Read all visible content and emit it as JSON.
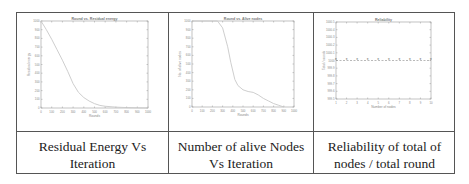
{
  "table": {
    "captions": [
      "Residual Energy Vs Iteration",
      "Number of alive Nodes Vs Iteration",
      "Reliability of total of nodes / total round"
    ]
  },
  "chart_data": [
    {
      "type": "line",
      "title": "Round vs. Residual energy",
      "xlabel": "Rounds",
      "ylabel": "Residual energy",
      "xlim": [
        0,
        1000
      ],
      "ylim": [
        0,
        1000
      ],
      "xticks": [
        0,
        100,
        200,
        300,
        400,
        500,
        600,
        700,
        800,
        900,
        1000
      ],
      "yticks": [
        0,
        100,
        200,
        300,
        400,
        500,
        600,
        700,
        800,
        900,
        1000
      ],
      "grid": false,
      "series": [
        {
          "name": "Residual energy",
          "x": [
            0,
            50,
            100,
            150,
            200,
            250,
            300,
            350,
            400,
            450,
            500,
            550,
            600,
            700,
            800,
            900,
            1000
          ],
          "y": [
            1000,
            900,
            790,
            670,
            550,
            420,
            280,
            180,
            120,
            80,
            50,
            30,
            20,
            10,
            5,
            2,
            0
          ]
        }
      ]
    },
    {
      "type": "line",
      "title": "Round vs. Alive nodes",
      "xlabel": "Rounds",
      "ylabel": "No. of alive nodes",
      "xlim": [
        0,
        1000
      ],
      "ylim": [
        0,
        1000
      ],
      "xticks": [
        0,
        100,
        200,
        300,
        400,
        500,
        600,
        700,
        800,
        900,
        1000
      ],
      "yticks": [
        0,
        100,
        200,
        300,
        400,
        500,
        600,
        700,
        800,
        900,
        1000
      ],
      "grid": false,
      "series": [
        {
          "name": "Alive nodes",
          "x": [
            0,
            250,
            300,
            350,
            380,
            420,
            450,
            500,
            550,
            600,
            650,
            700,
            750,
            800,
            850,
            900
          ],
          "y": [
            1000,
            1000,
            920,
            700,
            520,
            320,
            250,
            200,
            180,
            170,
            140,
            100,
            70,
            40,
            20,
            0
          ]
        }
      ]
    },
    {
      "type": "line",
      "title": "Reliability",
      "xlabel": "Number of nodes",
      "ylabel": "Total / rounds",
      "xlim": [
        1,
        10
      ],
      "ylim": [
        999.5,
        1000.5
      ],
      "xticks": [
        1,
        2,
        3,
        4,
        5,
        6,
        7,
        8,
        9,
        10
      ],
      "yticks": [
        999.5,
        999.6,
        999.7,
        999.8,
        999.9,
        1000,
        1000.1,
        1000.2,
        1000.3,
        1000.4,
        1000.5
      ],
      "grid": false,
      "series": [
        {
          "name": "Reliability",
          "x": [
            1,
            2,
            3,
            4,
            5,
            6,
            7,
            8,
            9,
            10
          ],
          "y": [
            1000,
            1000,
            1000,
            1000,
            1000,
            1000,
            1000,
            1000,
            1000,
            1000
          ],
          "marker": "*",
          "linestyle": "dashed"
        }
      ]
    }
  ]
}
